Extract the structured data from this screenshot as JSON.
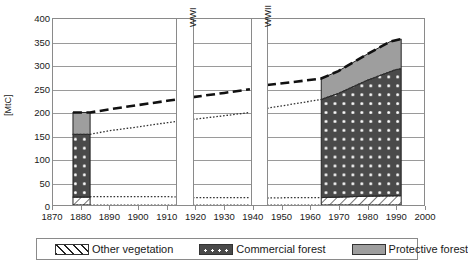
{
  "chart_data": {
    "type": "area",
    "title": "",
    "xlabel": "",
    "ylabel": "[MtC]",
    "ylim": [
      0,
      400
    ],
    "xlim": [
      1870,
      2000
    ],
    "yticks": [
      400,
      350,
      300,
      250,
      200,
      150,
      100,
      50,
      0
    ],
    "xticks": [
      1870,
      1880,
      1890,
      1900,
      1910,
      1920,
      1930,
      1940,
      1950,
      1960,
      1970,
      1980,
      1990,
      2000
    ],
    "grid": true,
    "legend_position": "bottom",
    "annotations": [
      {
        "label": "WWI",
        "x_start": 1913,
        "x_end": 1919,
        "orientation": "vertical"
      },
      {
        "label": "WWII",
        "x_start": 1939,
        "x_end": 1945,
        "orientation": "vertical"
      }
    ],
    "series": [
      {
        "name": "Other vegetation",
        "style": "hatched-fill-and-dotted-line",
        "points": [
          {
            "x": 1877,
            "y": 17
          },
          {
            "x": 1883,
            "y": 18
          },
          {
            "x": 1890,
            "y": 18
          },
          {
            "x": 1900,
            "y": 18
          },
          {
            "x": 1910,
            "y": 18
          },
          {
            "x": 1919,
            "y": 16
          },
          {
            "x": 1930,
            "y": 16
          },
          {
            "x": 1939,
            "y": 16
          },
          {
            "x": 1945,
            "y": 15
          },
          {
            "x": 1955,
            "y": 16
          },
          {
            "x": 1964,
            "y": 16
          },
          {
            "x": 1970,
            "y": 17
          },
          {
            "x": 1980,
            "y": 19
          },
          {
            "x": 1992,
            "y": 20
          }
        ]
      },
      {
        "name": "Commercial forest",
        "style": "dark-dotted-fill",
        "cumulative_top_points": [
          {
            "x": 1877,
            "y": 152
          },
          {
            "x": 1883,
            "y": 152
          },
          {
            "x": 1890,
            "y": 160
          },
          {
            "x": 1900,
            "y": 168
          },
          {
            "x": 1910,
            "y": 177
          },
          {
            "x": 1919,
            "y": 184
          },
          {
            "x": 1930,
            "y": 192
          },
          {
            "x": 1939,
            "y": 199
          },
          {
            "x": 1945,
            "y": 208
          },
          {
            "x": 1955,
            "y": 218
          },
          {
            "x": 1964,
            "y": 227
          },
          {
            "x": 1970,
            "y": 240
          },
          {
            "x": 1980,
            "y": 268
          },
          {
            "x": 1990,
            "y": 291
          },
          {
            "x": 1992,
            "y": 293
          }
        ]
      },
      {
        "name": "Protective forest",
        "style": "grey-fill",
        "cumulative_top_points": [
          {
            "x": 1877,
            "y": 199
          },
          {
            "x": 1883,
            "y": 199
          },
          {
            "x": 1890,
            "y": 206
          },
          {
            "x": 1900,
            "y": 215
          },
          {
            "x": 1910,
            "y": 224
          },
          {
            "x": 1919,
            "y": 232
          },
          {
            "x": 1930,
            "y": 241
          },
          {
            "x": 1939,
            "y": 249
          },
          {
            "x": 1945,
            "y": 258
          },
          {
            "x": 1955,
            "y": 265
          },
          {
            "x": 1964,
            "y": 272
          },
          {
            "x": 1970,
            "y": 288
          },
          {
            "x": 1980,
            "y": 324
          },
          {
            "x": 1988,
            "y": 351
          },
          {
            "x": 1992,
            "y": 357
          }
        ]
      }
    ],
    "bars": [
      {
        "x_start": 1877,
        "x_end": 1883,
        "other_vegetation": 17,
        "commercial_forest": 135,
        "protective_forest": 47,
        "total": 199
      }
    ],
    "filled_area_range": [
      1964,
      1992
    ],
    "legend": [
      {
        "label": "Other vegetation",
        "pattern": "diagonal-hatch",
        "color": "#ffffff"
      },
      {
        "label": "Commercial forest",
        "pattern": "dots",
        "color": "#4a4a4a"
      },
      {
        "label": "Protective forest",
        "pattern": "solid",
        "color": "#9e9e9e"
      }
    ]
  },
  "colors": {
    "commercial_forest": "#4a4a4a",
    "protective_forest": "#9e9e9e",
    "other_vegetation": "#ffffff",
    "axis": "#8a8a8a",
    "grid": "#9a9a9a",
    "line": "#111111"
  }
}
